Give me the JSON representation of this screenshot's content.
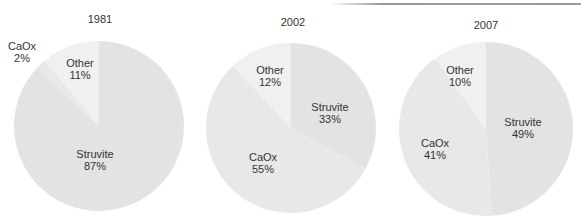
{
  "chart_data": [
    {
      "type": "pie",
      "title": "1981",
      "slices": [
        {
          "label": "Struvite",
          "value": 87,
          "display": "87%"
        },
        {
          "label": "CaOx",
          "value": 2,
          "display": "2%"
        },
        {
          "label": "Other",
          "value": 11,
          "display": "11%"
        }
      ]
    },
    {
      "type": "pie",
      "title": "2002",
      "slices": [
        {
          "label": "Struvite",
          "value": 33,
          "display": "33%"
        },
        {
          "label": "CaOx",
          "value": 55,
          "display": "55%"
        },
        {
          "label": "Other",
          "value": 12,
          "display": "12%"
        }
      ]
    },
    {
      "type": "pie",
      "title": "2007",
      "slices": [
        {
          "label": "Struvite",
          "value": 49,
          "display": "49%"
        },
        {
          "label": "CaOx",
          "value": 41,
          "display": "41%"
        },
        {
          "label": "Other",
          "value": 10,
          "display": "10%"
        }
      ]
    }
  ],
  "colors": {
    "Struvite": "#e3e3e3",
    "CaOx": "#e8e8e8",
    "Other": "#f0f0f0"
  }
}
